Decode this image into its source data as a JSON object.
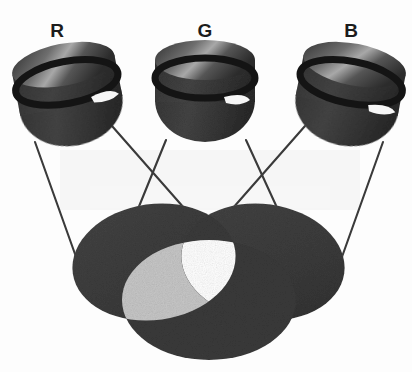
{
  "figure": {
    "background_color": "#fdfdfd",
    "width": 412,
    "height": 372
  },
  "palette": {
    "disc_fill": "#3c3c3c",
    "disc_fill_dark": "#343434",
    "pair_overlap_fill": "#c6c6c6",
    "triple_overlap_fill": "#ffffff",
    "lamp_body": "#3a3a3a",
    "lamp_body_dark": "#2b2b2b",
    "lamp_top_light": "#8f8f8f",
    "lamp_band": "#1a1a1a",
    "highlight": "#f4f4f4",
    "beam_line": "#3a3a3a",
    "label_color": "#1c1c1c"
  },
  "lamps": [
    {
      "id": "lamp-r",
      "label": "R",
      "label_x": 57,
      "label_y": 37,
      "cx": 71,
      "cy": 104,
      "rx": 52,
      "ry": 44,
      "rotate": -11,
      "highlight_name": "lens-highlight-r"
    },
    {
      "id": "lamp-g",
      "label": "G",
      "label_x": 205,
      "label_y": 37,
      "cx": 205,
      "cy": 100,
      "rx": 50,
      "ry": 44,
      "rotate": 0,
      "highlight_name": "lens-highlight-g"
    },
    {
      "id": "lamp-b",
      "label": "B",
      "label_x": 351,
      "label_y": 37,
      "cx": 347,
      "cy": 104,
      "rx": 52,
      "ry": 44,
      "rotate": 11,
      "highlight_name": "lens-highlight-b"
    }
  ],
  "light_pools": [
    {
      "id": "pool-left",
      "name": "light-pool-red",
      "cx": 154,
      "cy": 262,
      "rx": 82,
      "ry": 58,
      "rotate": -8
    },
    {
      "id": "pool-right",
      "name": "light-pool-green",
      "cx": 263,
      "cy": 262,
      "rx": 82,
      "ry": 58,
      "rotate": 8
    },
    {
      "id": "pool-bottom",
      "name": "light-pool-blue",
      "cx": 209,
      "cy": 300,
      "rx": 87,
      "ry": 60,
      "rotate": 0
    }
  ],
  "beams": [
    {
      "name": "beam-r-left",
      "x1": 35,
      "y1": 142,
      "x2": 80,
      "y2": 268
    },
    {
      "name": "beam-r-right",
      "x1": 112,
      "y1": 126,
      "x2": 196,
      "y2": 222
    },
    {
      "name": "beam-g-left",
      "x1": 166,
      "y1": 140,
      "x2": 128,
      "y2": 235
    },
    {
      "name": "beam-g-right",
      "x1": 246,
      "y1": 140,
      "x2": 288,
      "y2": 235
    },
    {
      "name": "beam-b-left",
      "x1": 305,
      "y1": 126,
      "x2": 220,
      "y2": 222
    },
    {
      "name": "beam-b-right",
      "x1": 383,
      "y1": 142,
      "x2": 338,
      "y2": 268
    }
  ],
  "annotations": {
    "triple_overlap_label": "white",
    "pair_overlap_label": "light grey"
  }
}
